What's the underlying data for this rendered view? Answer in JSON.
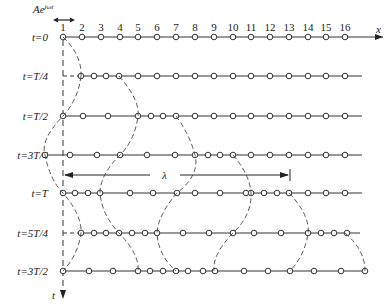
{
  "title_amplitude": "Ae^{jωt}",
  "amp_label": "Ae",
  "amp_sup": "jωt",
  "x_axis_label": "x",
  "t_axis_label": "t",
  "lambda_label": "λ",
  "particle_numbers": [
    "1",
    "2",
    "3",
    "4",
    "5",
    "6",
    "7",
    "8",
    "9",
    "10",
    "11",
    "12",
    "13",
    "14",
    "15",
    "16"
  ],
  "rows": [
    {
      "label": "t=0",
      "y": 37,
      "line_end": 383,
      "circles": [
        63,
        82,
        101,
        120,
        138,
        157,
        176,
        195,
        214,
        233,
        251,
        270,
        289,
        308,
        326,
        345
      ]
    },
    {
      "label": "t=T/4",
      "y": 76,
      "line_end": 362,
      "circles": [
        81,
        94,
        106,
        119,
        138,
        157,
        176,
        195,
        214,
        233,
        251,
        270,
        289,
        308,
        326,
        345
      ]
    },
    {
      "label": "t=T/2",
      "y": 116,
      "line_end": 362,
      "circles": [
        63,
        83,
        108,
        138,
        151,
        163,
        176,
        195,
        214,
        233,
        251,
        270,
        289,
        308,
        326,
        345
      ]
    },
    {
      "label": "t=3T/4",
      "y": 155,
      "line_end": 362,
      "circles": [
        45,
        70,
        97,
        120,
        147,
        175,
        195,
        208,
        220,
        233,
        251,
        270,
        289,
        308,
        326,
        345
      ]
    },
    {
      "label": "t=T",
      "y": 193,
      "line_end": 362,
      "circles": [
        63,
        75,
        88,
        100,
        130,
        153,
        177,
        195,
        220,
        246,
        251,
        264,
        277,
        289,
        308,
        326,
        345
      ]
    },
    {
      "label": "t=5T/4",
      "y": 233,
      "line_end": 360,
      "circles": [
        81,
        94,
        106,
        119,
        132,
        145,
        157,
        183,
        209,
        233,
        254,
        281,
        308,
        321,
        334,
        347
      ]
    },
    {
      "label": "t=3T/2",
      "y": 271,
      "line_end": 362,
      "circles": [
        63,
        89,
        113,
        138,
        150,
        163,
        176,
        188,
        203,
        215,
        244,
        268,
        290,
        314,
        341,
        365
      ]
    }
  ],
  "wave_crossings": "dashed curves connect compressed particles across rows"
}
